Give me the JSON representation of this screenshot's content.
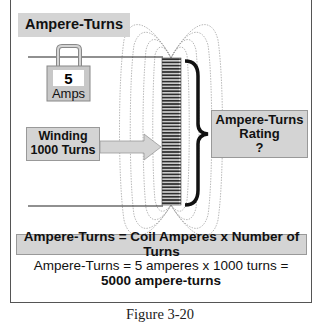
{
  "diagram": {
    "title_label": "Ampere-Turns",
    "ammeter": {
      "value": "5",
      "unit": "Amps"
    },
    "winding_label": {
      "line1": "Winding",
      "line2": "1000 Turns"
    },
    "rating_label": {
      "line1": "Ampere-Turns",
      "line2": "Rating",
      "line3": "?"
    },
    "formula": "Ampere-Turns = Coil Amperes x Number of Turns",
    "example": {
      "line1": "Ampere-Turns = 5 amperes x 1000 turns =",
      "line2": "5000 ampere-turns"
    },
    "caption": "Figure 3-20"
  },
  "colors": {
    "label_fill": "#d4d4d4",
    "frame_border": "#555555",
    "field_lines": "#9a9a9a",
    "coil": "#333333"
  }
}
